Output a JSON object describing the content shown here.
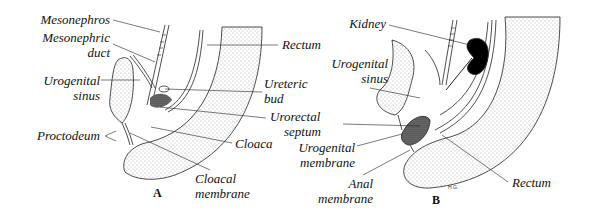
{
  "figure": {
    "panels": [
      {
        "id": "A",
        "letter": "A",
        "labels": {
          "mesonephros": "Mesonephros",
          "mesonephric_duct_1": "Mesonephric",
          "mesonephric_duct_2": "duct",
          "urogenital_sinus_1": "Urogenital",
          "urogenital_sinus_2": "sinus",
          "proctodeum": "Proctodeum",
          "rectum": "Rectum",
          "ureteric_bud_1": "Ureteric",
          "ureteric_bud_2": "bud",
          "cloaca": "Cloaca",
          "cloacal_membrane_1": "Cloacal",
          "cloacal_membrane_2": "membrane"
        }
      },
      {
        "id": "B",
        "letter": "B",
        "labels": {
          "kidney": "Kidney",
          "urogenital_sinus_1": "Urogenital",
          "urogenital_sinus_2": "sinus",
          "urorectal_septum_1": "Urorectal",
          "urorectal_septum_2": "septum",
          "urogenital_membrane_1": "Urogenital",
          "urogenital_membrane_2": "membrane",
          "anal_membrane_1": "Anal",
          "anal_membrane_2": "membrane",
          "rectum": "Rectum"
        },
        "signature": "H.G."
      }
    ]
  }
}
